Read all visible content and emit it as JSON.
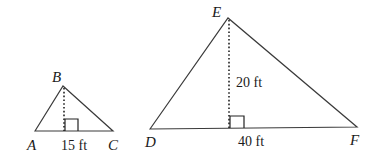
{
  "diagram": {
    "small_triangle": {
      "vertices": {
        "A": "A",
        "B": "B",
        "C": "C"
      },
      "base_label": "15 ft",
      "altitude_label": ""
    },
    "large_triangle": {
      "vertices": {
        "D": "D",
        "E": "E",
        "F": "F"
      },
      "base_label": "40 ft",
      "altitude_label": "20 ft"
    },
    "colors": {
      "stroke": "#3a3a3a",
      "text": "#1a1a1a",
      "background": "#ffffff"
    }
  }
}
